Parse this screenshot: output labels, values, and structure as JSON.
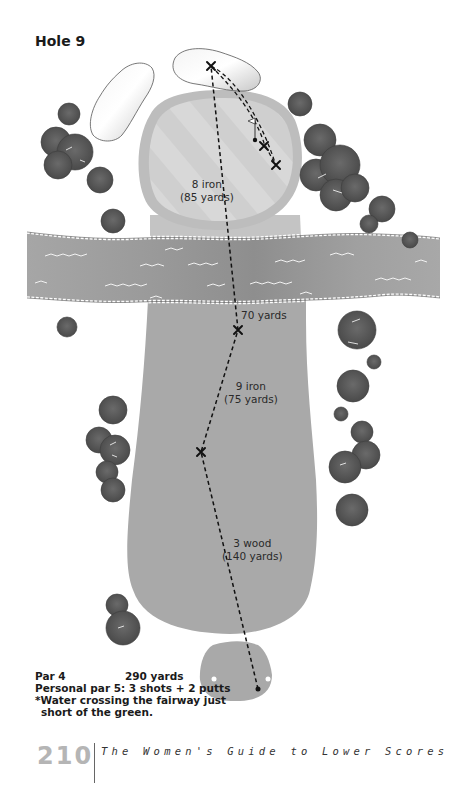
{
  "hole": {
    "title": "Hole 9"
  },
  "shots": [
    {
      "club": "3 wood",
      "distance": "(140 yards)"
    },
    {
      "club": "9 iron",
      "distance": "(75 yards)"
    },
    {
      "club": "",
      "distance": "70 yards"
    },
    {
      "club": "8 iron",
      "distance": "(85 yards)"
    }
  ],
  "info": {
    "par": "Par 4",
    "yards": "290 yards",
    "personal_par": "Personal par 5: 3 shots + 2 putts",
    "note_line1": "*Water crossing the fairway just",
    "note_line2": "short of the green."
  },
  "footer": {
    "page_number": "210",
    "book_title": "The Women's Guide to Lower Scores"
  },
  "colors": {
    "fairway": "#a9a9a9",
    "green": "#d6d6d6",
    "fringe": "#bcbcbc",
    "water": "#9c9c9c",
    "bunker": "#e8e8e8",
    "tree": "#5a5a5a",
    "text": "#1a1a1a",
    "page_number": "#b5b5b5"
  }
}
